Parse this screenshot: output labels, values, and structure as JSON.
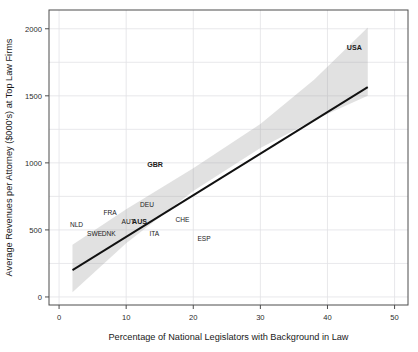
{
  "chart_data": {
    "type": "scatter",
    "title": "",
    "xlabel": "Percentage of National Legislators with Background in Law",
    "ylabel": "Average Revenues per Attorney ($000's) at Top Law Firms",
    "xlim": [
      -1.5,
      52
    ],
    "ylim": [
      -60,
      2140
    ],
    "xticks": [
      0,
      10,
      20,
      30,
      40,
      50
    ],
    "xtick_labels": [
      "0",
      "10",
      "20",
      "30",
      "40",
      "50"
    ],
    "yticks": [
      0,
      500,
      1000,
      1500,
      2000
    ],
    "ytick_labels": [
      "0",
      "500",
      "1000",
      "1500",
      "2000"
    ],
    "grid": true,
    "grid_x": [
      0,
      10,
      20,
      30,
      40,
      50
    ],
    "grid_y": [
      0,
      250,
      500,
      750,
      1000,
      1250,
      1500,
      1750,
      2000
    ],
    "legend": "none",
    "annotations_are_labels": true,
    "points": [
      {
        "label": "NLD",
        "x": 2.6,
        "y": 520,
        "bold": false
      },
      {
        "label": "SWE",
        "x": 5.3,
        "y": 455,
        "bold": false
      },
      {
        "label": "DNK",
        "x": 7.4,
        "y": 452,
        "bold": false
      },
      {
        "label": "FRA",
        "x": 7.6,
        "y": 610,
        "bold": false
      },
      {
        "label": "AUT",
        "x": 10.3,
        "y": 545,
        "bold": false
      },
      {
        "label": "AUS",
        "x": 12.0,
        "y": 545,
        "bold": true
      },
      {
        "label": "DEU",
        "x": 13.1,
        "y": 672,
        "bold": false
      },
      {
        "label": "ITA",
        "x": 14.2,
        "y": 455,
        "bold": false
      },
      {
        "label": "CHE",
        "x": 18.4,
        "y": 560,
        "bold": false
      },
      {
        "label": "ESP",
        "x": 21.6,
        "y": 415,
        "bold": false
      },
      {
        "label": "GBR",
        "x": 14.3,
        "y": 970,
        "bold": true
      },
      {
        "label": "USA",
        "x": 44.0,
        "y": 1840,
        "bold": true
      }
    ],
    "fit_line": {
      "description": "linear regression trend line",
      "x_start": 2.0,
      "y_start": 200,
      "x_end": 46.0,
      "y_end": 1565,
      "color": "#111111"
    },
    "confidence_band": {
      "description": "shaded grey confidence interval around the regression line",
      "color": "#9a9a9a",
      "upper": [
        {
          "x": 2.0,
          "y": 390
        },
        {
          "x": 10.0,
          "y": 655
        },
        {
          "x": 20.0,
          "y": 960
        },
        {
          "x": 30.0,
          "y": 1290
        },
        {
          "x": 38.0,
          "y": 1620
        },
        {
          "x": 46.0,
          "y": 2010
        }
      ],
      "lower": [
        {
          "x": 2.0,
          "y": 35
        },
        {
          "x": 10.0,
          "y": 400
        },
        {
          "x": 20.0,
          "y": 790
        },
        {
          "x": 30.0,
          "y": 1110
        },
        {
          "x": 38.0,
          "y": 1320
        },
        {
          "x": 46.0,
          "y": 1500
        }
      ]
    }
  }
}
